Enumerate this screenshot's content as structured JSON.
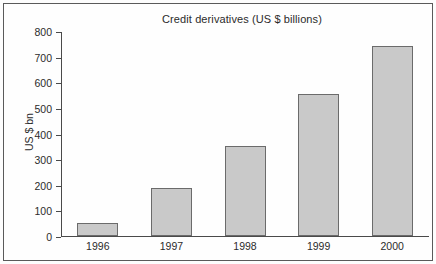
{
  "chart_data": {
    "type": "bar",
    "title": "Credit derivatives (US $ billions)",
    "xlabel": "",
    "ylabel": "US $ bn",
    "categories": [
      "1996",
      "1997",
      "1998",
      "1999",
      "2000"
    ],
    "values": [
      50,
      187,
      351,
      554,
      741
    ],
    "ylim": [
      0,
      800
    ],
    "ytick_labels": [
      "800",
      "700",
      "600",
      "500",
      "400",
      "300",
      "200",
      "100",
      "0"
    ],
    "ytick_values": [
      800,
      700,
      600,
      500,
      400,
      300,
      200,
      100,
      0
    ],
    "grid": false,
    "legend": null,
    "series": [
      {
        "name": "Credit derivatives",
        "values": [
          50,
          187,
          351,
          554,
          741
        ]
      }
    ],
    "colors": {
      "bar_fill": "#c9c9c9",
      "bar_border": "#6b6b6b",
      "axis": "#4a4a4a",
      "text": "#2b2b2b",
      "frame": "#5a5a5a",
      "background": "#fefefe"
    }
  }
}
